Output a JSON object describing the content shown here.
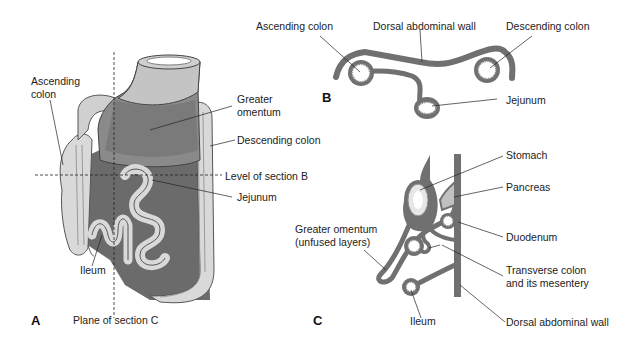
{
  "figure": {
    "panels": [
      {
        "id": "A",
        "letter": "A",
        "description": "Anterior view of abdominal viscera",
        "labels": {
          "ascending_colon_1": "Ascending",
          "ascending_colon_2": "colon",
          "greater_omentum_1": "Greater",
          "greater_omentum_2": "omentum",
          "descending_colon": "Descending colon",
          "level_section_b": "Level of section B",
          "jejunum": "Jejunum",
          "ileum": "Ileum",
          "plane_section_c": "Plane of section C"
        }
      },
      {
        "id": "B",
        "letter": "B",
        "description": "Transverse section at level B",
        "labels": {
          "ascending_colon": "Ascending colon",
          "dorsal_abdominal_wall": "Dorsal abdominal wall",
          "descending_colon": "Descending colon",
          "jejunum": "Jejunum"
        }
      },
      {
        "id": "C",
        "letter": "C",
        "description": "Sagittal section along plane C",
        "labels": {
          "stomach": "Stomach",
          "pancreas": "Pancreas",
          "greater_omentum_1": "Greater omentum",
          "greater_omentum_2": "(unfused layers)",
          "duodenum": "Duodenum",
          "transverse_colon_1": "Transverse colon",
          "transverse_colon_2": "and its mesentery",
          "ileum": "Ileum",
          "dorsal_abdominal_wall": "Dorsal abdominal wall"
        }
      }
    ],
    "colors": {
      "tissue_dark": "#6e6e6e",
      "tissue_mid": "#8a8a8a",
      "tissue_light": "#d6d6d6",
      "mucosa": "#e8e8e8",
      "leader_line": "#333333"
    }
  }
}
